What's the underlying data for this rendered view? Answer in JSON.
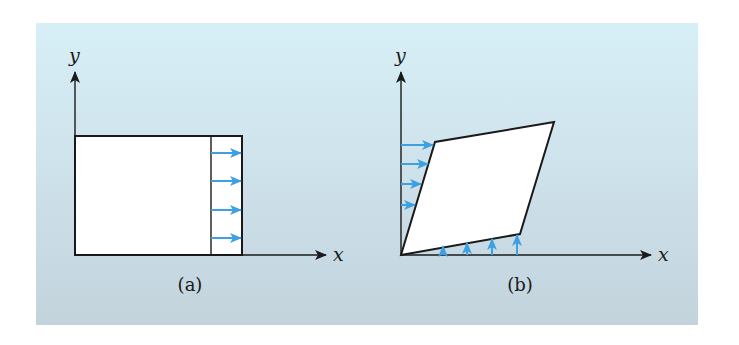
{
  "figure": {
    "background": {
      "top_color": "#d7eff6",
      "bottom_color": "#c2d3dc"
    },
    "colors": {
      "line": "#1a1a1a",
      "arrow": "#3ea0e0",
      "shape_fill": "#ffffff"
    },
    "panels": [
      {
        "id": "a",
        "caption": "(a)",
        "x_axis_label": "x",
        "y_axis_label": "y",
        "shape": "rectangle with displaced right strip",
        "arrows": {
          "direction": "right",
          "count": 4
        }
      },
      {
        "id": "b",
        "caption": "(b)",
        "x_axis_label": "x",
        "y_axis_label": "y",
        "shape": "sheared parallelogram",
        "arrows": [
          {
            "edge": "left",
            "direction": "right",
            "count": 4
          },
          {
            "edge": "bottom",
            "direction": "up",
            "count": 4
          }
        ]
      }
    ]
  }
}
